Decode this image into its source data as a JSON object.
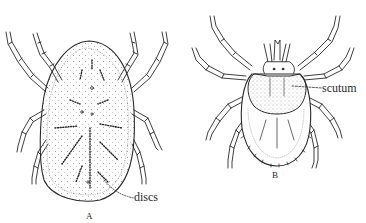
{
  "figure": {
    "panels": [
      {
        "id": "A",
        "caption": "A",
        "subject": "soft tick (dorsal view)",
        "annotation": {
          "label": "discs"
        }
      },
      {
        "id": "B",
        "caption": "B",
        "subject": "hard tick (dorsal view)",
        "annotation": {
          "label": "scutum"
        }
      }
    ],
    "colors": {
      "ink": "#2a2a2a",
      "background": "#ffffff"
    }
  }
}
